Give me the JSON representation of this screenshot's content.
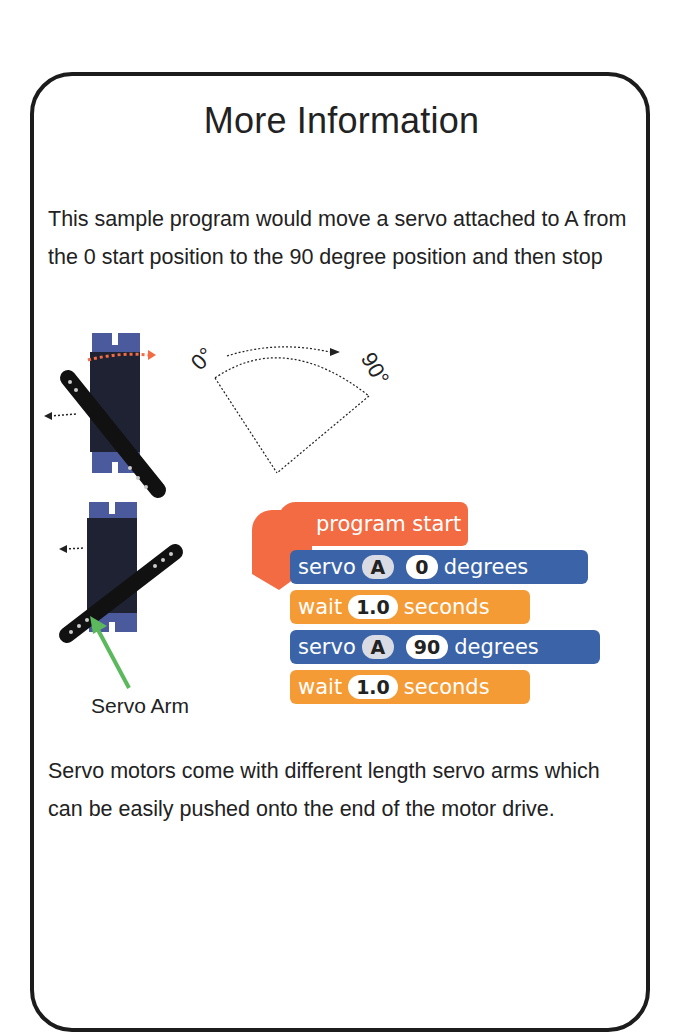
{
  "card": {
    "title": "More Information",
    "intro": "This sample program would move a servo attached to A from the 0 start position to the 90 degree position and then stop",
    "outro": "Servo motors come with different length servo arms which can be easily pushed onto the end of the motor drive."
  },
  "diagram": {
    "start_angle_label": "0°",
    "end_angle_label": "90°",
    "arm_caption": "Servo Arm"
  },
  "program": {
    "hat": "program start",
    "blocks": [
      {
        "kind": "servo",
        "keyword": "servo",
        "port": "A",
        "value": "0",
        "unit": "degrees"
      },
      {
        "kind": "wait",
        "keyword": "wait",
        "value": "1.0",
        "unit": "seconds"
      },
      {
        "kind": "servo",
        "keyword": "servo",
        "port": "A",
        "value": "90",
        "unit": "degrees"
      },
      {
        "kind": "wait",
        "keyword": "wait",
        "value": "1.0",
        "unit": "seconds"
      }
    ]
  },
  "colors": {
    "hat_block": "#f26b43",
    "servo_block": "#3b64a8",
    "wait_block": "#f59b35",
    "pointer_arrow": "#5cb85c",
    "servo_body": "#3f4f8f"
  }
}
